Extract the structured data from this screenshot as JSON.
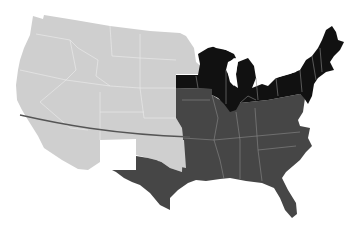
{
  "map": {
    "title": "United States regional map",
    "colors": {
      "background": "#ffffff",
      "west_territories": "#cfcfcf",
      "north_states": "#111111",
      "south_states": "#464646",
      "state_borders_light": "#ececec",
      "state_borders_dark": "#9a9a9a",
      "dividing_line": "#555555"
    },
    "regions": [
      {
        "id": "west",
        "label": "Western states and territories",
        "shade": "light gray"
      },
      {
        "id": "north",
        "label": "Northern states",
        "shade": "black"
      },
      {
        "id": "south",
        "label": "Southern states",
        "shade": "dark gray"
      }
    ],
    "annotations": [
      {
        "id": "latitude-line",
        "label": "Horizontal dividing line across the western region"
      }
    ]
  }
}
